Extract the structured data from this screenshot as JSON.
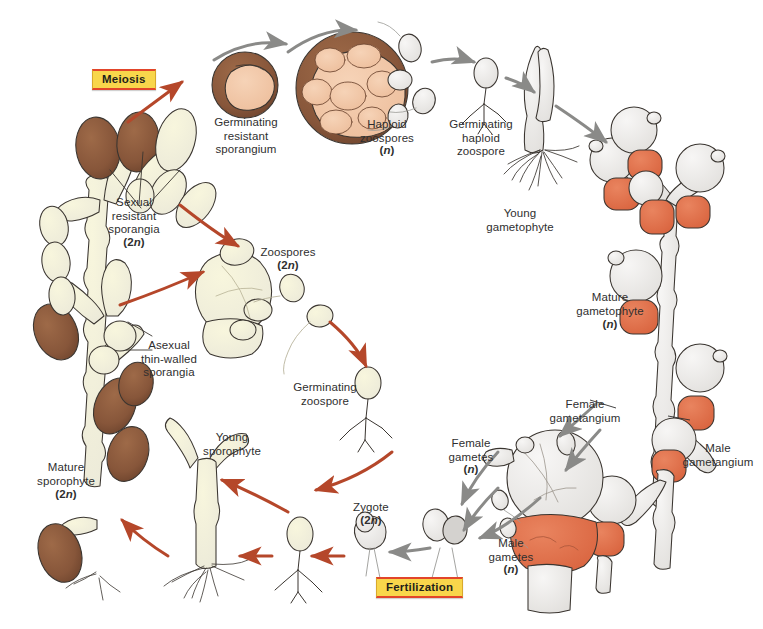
{
  "figure": {
    "kind": "biological-life-cycle-diagram",
    "background_color": "#ffffff"
  },
  "palette": {
    "sporophyte_cream": "#f2efc9",
    "resistant_sporangium_brown": "#8c5a3c",
    "sporangium_brown_light": "#a9apricot",
    "gametophyte_white": "#ebe9e7",
    "male_gametangium_orange": "#e0744f",
    "red_arrow": "#b5472a",
    "gray_arrow": "#8a8a88",
    "outline": "#3a3530",
    "label_text": "#2f2f2f",
    "phase_box_fill": "#f8d64b",
    "phase_box_border": "#e2452a"
  },
  "phase_boxes": [
    {
      "id": "meiosis",
      "label": "Meiosis"
    },
    {
      "id": "fertilization",
      "label": "Fertilization"
    }
  ],
  "labels": [
    {
      "id": "meiosis-box",
      "text": "Meiosis"
    },
    {
      "id": "germinating-resistant-sporangium",
      "text": "Germinating\nresistant\nsporangium"
    },
    {
      "id": "haploid-zoospores",
      "text": "Haploid\nzoospores",
      "ploidy": "(n)"
    },
    {
      "id": "germinating-haploid-zoospore",
      "text": "Germinating\nhaploid\nzoospore"
    },
    {
      "id": "young-gametophyte",
      "text": "Young\ngametophyte"
    },
    {
      "id": "mature-gametophyte",
      "text": "Mature\ngametophyte",
      "ploidy": "(n)"
    },
    {
      "id": "female-gametangium",
      "text": "Female\ngametangium"
    },
    {
      "id": "male-gametangium",
      "text": "Male\ngametangium"
    },
    {
      "id": "female-gametes",
      "text": "Female\ngametes",
      "ploidy": "(n)"
    },
    {
      "id": "male-gametes",
      "text": "Male\ngametes",
      "ploidy": "(n)"
    },
    {
      "id": "fertilization-box",
      "text": "Fertilization"
    },
    {
      "id": "zygote",
      "text": "Zygote",
      "ploidy": "(2n)"
    },
    {
      "id": "young-sporophyte",
      "text": "Young\nsporophyte"
    },
    {
      "id": "mature-sporophyte",
      "text": "Mature\nsporophyte",
      "ploidy": "(2n)"
    },
    {
      "id": "asexual-thin-walled-sporangia",
      "text": "Asexual\nthin-walled\nsporangia"
    },
    {
      "id": "sexual-resistant-sporangia",
      "text": "Sexual\nresistant\nsporangia",
      "ploidy": "(2n)"
    },
    {
      "id": "zoospores",
      "text": "Zoospores",
      "ploidy": "(2n)"
    },
    {
      "id": "germinating-zoospore",
      "text": "Germinating\nzoospore"
    }
  ],
  "stages": {
    "mature_sporophyte": {
      "name": "Mature sporophyte",
      "ploidy": "2n"
    },
    "sexual_resistant_sporangia": {
      "name": "Sexual resistant sporangia",
      "ploidy": "2n"
    },
    "germinating_resistant_sporangium": {
      "name": "Germinating resistant sporangium",
      "ploidy": ""
    },
    "haploid_zoospores": {
      "name": "Haploid zoospores",
      "ploidy": "n"
    },
    "germinating_haploid_zoospore": {
      "name": "Germinating haploid zoospore",
      "ploidy": "n"
    },
    "young_gametophyte": {
      "name": "Young gametophyte",
      "ploidy": "n"
    },
    "mature_gametophyte": {
      "name": "Mature gametophyte",
      "ploidy": "n"
    },
    "female_gametangium": {
      "name": "Female gametangium",
      "ploidy": "n"
    },
    "male_gametangium": {
      "name": "Male gametangium",
      "ploidy": "n"
    },
    "female_gametes": {
      "name": "Female gametes",
      "ploidy": "n"
    },
    "male_gametes": {
      "name": "Male gametes",
      "ploidy": "n"
    },
    "zygote": {
      "name": "Zygote",
      "ploidy": "2n"
    },
    "young_sporophyte": {
      "name": "Young sporophyte",
      "ploidy": "2n"
    },
    "asexual_thin_walled_sporangia": {
      "name": "Asexual thin-walled sporangia",
      "ploidy": "2n"
    },
    "zoospores": {
      "name": "Zoospores",
      "ploidy": "2n"
    },
    "germinating_zoospore": {
      "name": "Germinating zoospore",
      "ploidy": "2n"
    }
  }
}
